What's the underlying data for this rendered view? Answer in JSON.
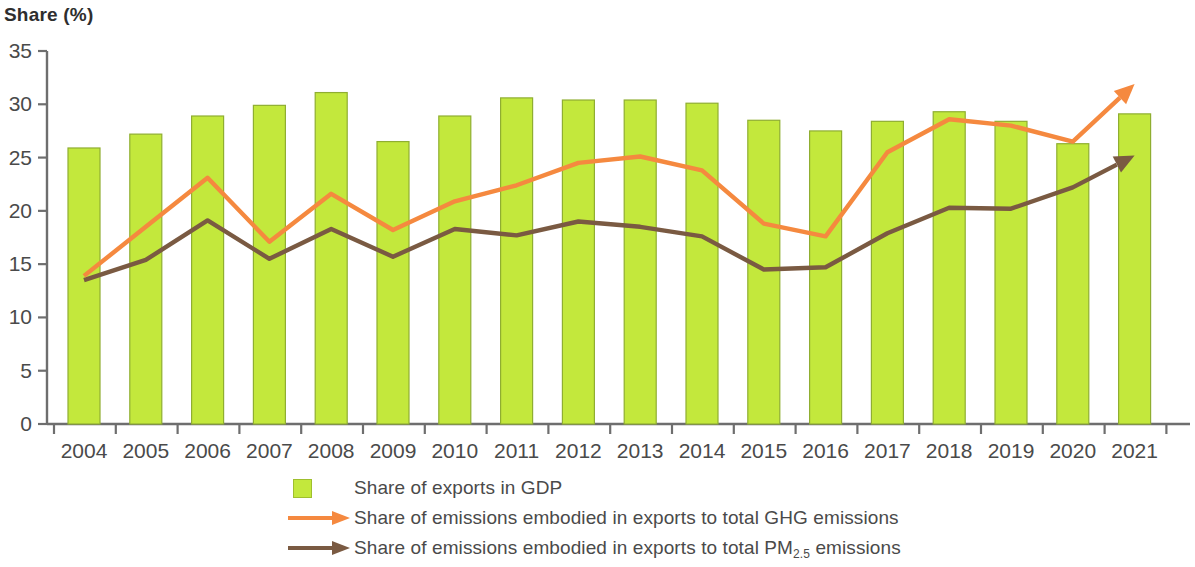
{
  "axis": {
    "y_title": "Share (%)",
    "y_ticks": [
      "35",
      "30",
      "25",
      "20",
      "15",
      "10",
      "5",
      "0"
    ],
    "y_min": 0,
    "y_max": 35,
    "x_labels": [
      "2004",
      "2005",
      "2006",
      "2007",
      "2008",
      "2009",
      "2010",
      "2011",
      "2012",
      "2013",
      "2014",
      "2015",
      "2016",
      "2017",
      "2018",
      "2019",
      "2020",
      "2021"
    ]
  },
  "colors": {
    "bar_fill": "#c3e83c",
    "bar_stroke": "#8fae31",
    "line_ghg": "#f5893f",
    "line_pm": "#7a5a42",
    "axis": "#6e6e6e",
    "text": "#4a4a4a"
  },
  "legend": {
    "items": [
      {
        "marker": "square-swatch",
        "label": "Share of exports in GDP",
        "label_prefix": "Share of exports in GDP",
        "label_sub": "",
        "label_suffix": ""
      },
      {
        "marker": "arrow-line-orange",
        "label": "Share of emissions embodied in exports to total GHG emissions",
        "label_prefix": "Share of emissions embodied in exports to total GHG emissions",
        "label_sub": "",
        "label_suffix": ""
      },
      {
        "marker": "arrow-line-brown",
        "label": "Share of emissions embodied in exports to total PM2.5 emissions",
        "label_prefix": "Share of emissions embodied in exports to total PM",
        "label_sub": "2.5",
        "label_suffix": " emissions"
      }
    ]
  },
  "chart_data": {
    "type": "bar",
    "title": "",
    "xlabel": "",
    "ylabel": "Share (%)",
    "ylim": [
      0,
      35
    ],
    "grid": false,
    "legend_position": "bottom",
    "categories": [
      "2004",
      "2005",
      "2006",
      "2007",
      "2008",
      "2009",
      "2010",
      "2011",
      "2012",
      "2013",
      "2014",
      "2015",
      "2016",
      "2017",
      "2018",
      "2019",
      "2020",
      "2021"
    ],
    "series": [
      {
        "name": "Share of exports in GDP",
        "type": "bar",
        "color": "#c3e83c",
        "values": [
          25.9,
          27.2,
          28.9,
          29.9,
          31.1,
          26.5,
          28.9,
          30.6,
          30.4,
          30.4,
          30.1,
          28.5,
          27.5,
          28.4,
          29.3,
          28.4,
          26.3,
          29.1
        ]
      },
      {
        "name": "Share of emissions embodied in exports to total GHG emissions",
        "type": "line",
        "color": "#f5893f",
        "values": [
          13.9,
          18.5,
          23.1,
          17.1,
          21.6,
          18.2,
          20.9,
          22.4,
          24.5,
          25.1,
          23.8,
          18.8,
          17.6,
          25.5,
          28.6,
          28.0,
          26.5,
          31.9
        ]
      },
      {
        "name": "Share of emissions embodied in exports to total PM2.5 emissions",
        "type": "line",
        "color": "#7a5a42",
        "values": [
          13.5,
          15.4,
          19.1,
          15.5,
          18.3,
          15.7,
          18.3,
          17.7,
          19.0,
          18.5,
          17.6,
          14.5,
          14.7,
          17.9,
          20.3,
          20.2,
          22.2,
          25.2
        ]
      }
    ]
  }
}
